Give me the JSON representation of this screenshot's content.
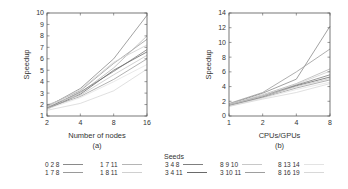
{
  "chart_data": [
    {
      "type": "line",
      "panel": "(a)",
      "title": "",
      "xlabel": "Number of nodes",
      "ylabel": "Speedup",
      "x": [
        2,
        4,
        8,
        16
      ],
      "xscale": "log2",
      "ylim": [
        1,
        10
      ],
      "yticks": [
        1,
        2,
        3,
        4,
        5,
        6,
        7,
        8,
        9,
        10
      ],
      "xticks": [
        2,
        4,
        8,
        16
      ],
      "grid": false,
      "series": [
        {
          "name": "0 2 8",
          "values": [
            1.8,
            3.4,
            6.0,
            9.8
          ]
        },
        {
          "name": "1 7 8",
          "values": [
            1.9,
            3.2,
            5.6,
            7.7
          ]
        },
        {
          "name": "1 7 11",
          "values": [
            1.7,
            3.0,
            5.2,
            8.0
          ]
        },
        {
          "name": "1 8 11",
          "values": [
            1.8,
            3.3,
            5.7,
            7.2
          ]
        },
        {
          "name": "3 4 8",
          "values": [
            1.7,
            3.1,
            4.9,
            6.8
          ]
        },
        {
          "name": "3 4 11",
          "values": [
            1.6,
            2.9,
            5.0,
            6.6
          ]
        },
        {
          "name": "8 9 10",
          "values": [
            2.0,
            2.8,
            4.6,
            6.3
          ]
        },
        {
          "name": "3 10 11",
          "values": [
            1.7,
            2.7,
            4.2,
            6.0
          ]
        },
        {
          "name": "8 13 14",
          "values": [
            1.6,
            2.6,
            4.0,
            5.5
          ]
        },
        {
          "name": "8 16 19",
          "values": [
            1.5,
            2.1,
            3.2,
            5.1
          ]
        }
      ]
    },
    {
      "type": "line",
      "panel": "(b)",
      "title": "",
      "xlabel": "CPUs/GPUs",
      "ylabel": "Speedup",
      "x": [
        1,
        2,
        4,
        8
      ],
      "xscale": "log2",
      "ylim": [
        0,
        14
      ],
      "yticks": [
        0,
        2,
        4,
        6,
        8,
        10,
        12,
        14
      ],
      "xticks": [
        1,
        2,
        4,
        8
      ],
      "grid": false,
      "series": [
        {
          "name": "0 2 8",
          "values": [
            1.6,
            3.1,
            5.0,
            12.2
          ]
        },
        {
          "name": "1 7 8",
          "values": [
            1.7,
            3.2,
            6.0,
            9.1
          ]
        },
        {
          "name": "1 7 11",
          "values": [
            1.5,
            2.9,
            4.4,
            6.4
          ]
        },
        {
          "name": "1 8 11",
          "values": [
            1.6,
            2.8,
            4.3,
            6.1
          ]
        },
        {
          "name": "3 4 8",
          "values": [
            1.5,
            2.7,
            4.2,
            5.6
          ]
        },
        {
          "name": "3 4 11",
          "values": [
            1.4,
            2.6,
            4.1,
            5.3
          ]
        },
        {
          "name": "8 9 10",
          "values": [
            1.5,
            2.7,
            4.0,
            5.1
          ]
        },
        {
          "name": "3 10 11",
          "values": [
            1.4,
            2.5,
            3.8,
            4.9
          ]
        },
        {
          "name": "8 13 14",
          "values": [
            1.3,
            2.4,
            3.6,
            4.6
          ]
        },
        {
          "name": "8 16 19",
          "values": [
            1.3,
            2.3,
            3.2,
            4.4
          ]
        }
      ]
    }
  ],
  "captions": {
    "a": "(a)",
    "b": "(b)"
  },
  "legend": {
    "title": "Seeds",
    "entries": [
      "0 2 8",
      "1 7 8",
      "1 7 11",
      "1 8 11",
      "3 4 8",
      "3 4 11",
      "8 9 10",
      "3 10 11",
      "8 13 14",
      "8 16 19"
    ],
    "colors": [
      "#8a8a8a",
      "#9a9a9a",
      "#b5b5b5",
      "#d0d0d0",
      "#7f7f7f",
      "#6a6a6a",
      "#c8c8c8",
      "#9e9e9e",
      "#e3e3e3",
      "#d8d8d8"
    ]
  }
}
